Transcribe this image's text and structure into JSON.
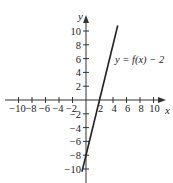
{
  "chart_data": {
    "type": "line",
    "title": "",
    "xlabel": "x",
    "ylabel": "y",
    "xlim": [
      -10.5,
      11.5
    ],
    "ylim": [
      -11,
      11.5
    ],
    "x_ticks": [
      -10,
      -8,
      -6,
      -4,
      -2,
      2,
      4,
      6,
      8,
      10
    ],
    "y_ticks": [
      -10,
      -8,
      -6,
      -4,
      -2,
      2,
      4,
      6,
      8,
      10
    ],
    "x_tick_labels": [
      "−10",
      "−8",
      "−6",
      "−4",
      "−2",
      "2",
      "4",
      "6",
      "8",
      "10"
    ],
    "y_tick_labels": [
      "−10",
      "−8",
      "−6",
      "−4",
      "−2",
      "2",
      "4",
      "6",
      "8",
      "10"
    ],
    "grid": false,
    "series": [
      {
        "name": "y = f(x) − 2",
        "equation": "y = 4x - 8",
        "x": [
          -0.6,
          4.7
        ],
        "y": [
          -10.4,
          10.8
        ]
      }
    ],
    "annotations": [
      {
        "text": "y = f(x) − 2",
        "x": 5.2,
        "y": 6.5
      }
    ]
  },
  "labels": {
    "x_axis": "x",
    "y_axis": "y",
    "curve": "y = f(x) − 2"
  },
  "colors": {
    "axis": "#333333",
    "line": "#222222",
    "text": "#222222"
  }
}
